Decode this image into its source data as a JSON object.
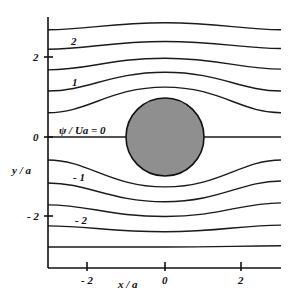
{
  "chart_data": {
    "type": "line",
    "title": "",
    "xlabel": "x / a",
    "ylabel": "y / a",
    "xlim": [
      -3,
      3
    ],
    "ylim": [
      -3,
      3
    ],
    "x_ticks": [
      -2,
      0,
      2
    ],
    "y_ticks": [
      2,
      0,
      -2
    ],
    "x_tick_labels": [
      "-2",
      "0",
      "2"
    ],
    "y_tick_labels": [
      "2",
      "0",
      "-2"
    ],
    "grid": false,
    "cylinder": {
      "center": [
        0,
        0
      ],
      "radius": 1,
      "fill": "#8f8f8f"
    },
    "streamline_label": "ψ / Ua = 0",
    "streamline_annotations": [
      {
        "text": "2",
        "x": -1.9,
        "y": 2.3
      },
      {
        "text": "1",
        "x": -1.85,
        "y": 1.45
      },
      {
        "text": "ψ / Ua = 0",
        "x": -2.2,
        "y": 0.25
      },
      {
        "text": "- 1",
        "x": -1.85,
        "y": -0.9
      },
      {
        "text": "- 2",
        "x": -1.9,
        "y": -1.75
      }
    ],
    "series": [
      {
        "name": "psi=2.5",
        "y_left": 2.75,
        "y_center": 2.93,
        "y_right": 2.75
      },
      {
        "name": "psi=2.0",
        "y_left": 2.25,
        "y_center": 2.45,
        "y_right": 2.27
      },
      {
        "name": "psi=1.5",
        "y_left": 1.72,
        "y_center": 2.02,
        "y_right": 1.74
      },
      {
        "name": "psi=1.0",
        "y_left": 1.18,
        "y_center": 1.66,
        "y_right": 1.18
      },
      {
        "name": "psi=0.5",
        "y_left": 0.62,
        "y_center": 1.28,
        "y_right": 0.62
      },
      {
        "name": "psi=0",
        "y_left": 0.0,
        "y_center": 0.0,
        "y_right": 0.0
      },
      {
        "name": "psi=-0.5",
        "y_left": -0.59,
        "y_center": -1.28,
        "y_right": -0.59
      },
      {
        "name": "psi=-1.0",
        "y_left": -1.18,
        "y_center": -1.66,
        "y_right": -1.13
      },
      {
        "name": "psi=-1.5",
        "y_left": -1.74,
        "y_center": -2.04,
        "y_right": -1.69
      },
      {
        "name": "psi=-2.0",
        "y_left": -2.28,
        "y_center": -2.43,
        "y_right": -2.26
      },
      {
        "name": "psi=-2.5",
        "y_left": -2.82,
        "y_center": -2.82,
        "y_right": -2.79
      }
    ]
  },
  "labels": {
    "xlabel": "x / a",
    "ylabel": "y / a",
    "xt0": "- 2",
    "xt1": "0",
    "xt2": "2",
    "yt0": "2",
    "yt1": "0",
    "yt2": "- 2",
    "a_psi2": "2",
    "a_psi1": "1",
    "a_psi0": "ψ / Ua = 0",
    "a_psim1": "- 1",
    "a_psim2": "- 2"
  }
}
